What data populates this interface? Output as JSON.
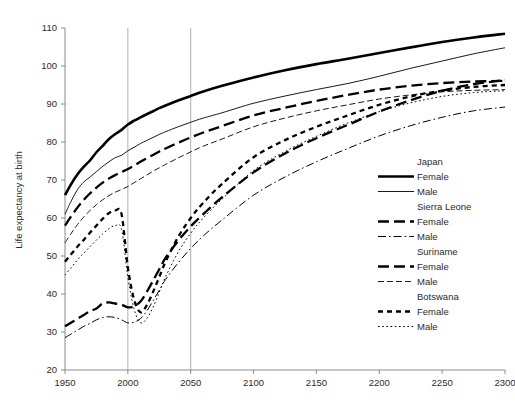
{
  "chart_data": {
    "type": "line",
    "title": "",
    "xlabel": "",
    "ylabel": "Life expectancy at birth",
    "xlim": [
      1950,
      2300
    ],
    "ylim": [
      20,
      110
    ],
    "xticks": [
      1950,
      2000,
      2050,
      2100,
      2150,
      2200,
      2250,
      2300
    ],
    "xtick_labels": [
      "1950",
      "2000",
      "2050",
      "2100",
      "2150",
      "2200",
      "2250",
      "2300"
    ],
    "yticks": [
      20,
      30,
      40,
      50,
      60,
      70,
      80,
      90,
      100,
      110
    ],
    "ytick_labels": [
      "20",
      "30",
      "40",
      "50",
      "60",
      "70",
      "80",
      "90",
      "100",
      "110"
    ],
    "grid": false,
    "vertical_reference_lines": [
      2000,
      2050
    ],
    "legend_position": "right-inside",
    "legend_groups": [
      {
        "country": "Japan",
        "entries": [
          {
            "label": "Female",
            "style": "solid-thick"
          },
          {
            "label": "Male",
            "style": "solid-thin"
          }
        ]
      },
      {
        "country": "Sierra Leone",
        "entries": [
          {
            "label": "Female",
            "style": "dashed-thick"
          },
          {
            "label": "Male",
            "style": "dashdot-thin"
          }
        ]
      },
      {
        "country": "Suriname",
        "entries": [
          {
            "label": "Female",
            "style": "dashed-thick"
          },
          {
            "label": "Male",
            "style": "dashed-thin"
          }
        ]
      },
      {
        "country": "Botswana",
        "entries": [
          {
            "label": "Female",
            "style": "dotted-dash-thick"
          },
          {
            "label": "Male",
            "style": "dotted-thin"
          }
        ]
      }
    ],
    "x": [
      1950,
      1955,
      1960,
      1965,
      1970,
      1975,
      1980,
      1985,
      1990,
      1995,
      2000,
      2005,
      2010,
      2015,
      2020,
      2025,
      2030,
      2040,
      2050,
      2060,
      2075,
      2100,
      2125,
      2150,
      2175,
      2200,
      2225,
      2250,
      2275,
      2300
    ],
    "series": [
      {
        "name": "Japan Female",
        "country": "Japan",
        "sex": "Female",
        "style": "solid-thick",
        "values": [
          66.0,
          69.0,
          71.5,
          73.5,
          75.2,
          77.3,
          79.0,
          80.8,
          82.1,
          83.2,
          84.6,
          85.6,
          86.5,
          87.3,
          88.1,
          88.9,
          89.6,
          90.9,
          92.1,
          93.3,
          94.8,
          97.0,
          98.9,
          100.5,
          101.9,
          103.4,
          104.9,
          106.3,
          107.5,
          108.5
        ]
      },
      {
        "name": "Japan Male",
        "country": "Japan",
        "sex": "Male",
        "style": "solid-thin",
        "values": [
          61.0,
          64.5,
          67.5,
          69.5,
          70.8,
          72.2,
          73.6,
          74.8,
          75.9,
          76.5,
          77.7,
          78.6,
          79.6,
          80.4,
          81.2,
          82.0,
          82.7,
          84.0,
          85.2,
          86.3,
          87.7,
          90.2,
          92.1,
          93.8,
          95.4,
          97.3,
          99.4,
          101.3,
          103.2,
          104.8
        ]
      },
      {
        "name": "Sierra Leone Female",
        "country": "Sierra Leone",
        "sex": "Female",
        "style": "dashed-thick",
        "values": [
          31.5,
          32.5,
          33.5,
          34.5,
          35.5,
          36.2,
          37.5,
          37.8,
          37.5,
          37.2,
          36.5,
          36.8,
          38.0,
          40.5,
          43.5,
          46.5,
          49.5,
          54.0,
          57.8,
          61.0,
          65.5,
          72.0,
          77.0,
          81.0,
          84.5,
          88.0,
          91.0,
          93.5,
          95.2,
          96.3
        ]
      },
      {
        "name": "Sierra Leone Male",
        "country": "Sierra Leone",
        "sex": "Male",
        "style": "dashdot-thin",
        "values": [
          28.5,
          29.5,
          30.5,
          31.5,
          32.3,
          33.2,
          33.8,
          34.0,
          33.8,
          33.2,
          32.4,
          32.6,
          33.5,
          35.5,
          38.2,
          41.0,
          43.8,
          48.2,
          52.0,
          55.3,
          59.5,
          66.0,
          70.8,
          74.8,
          78.3,
          81.6,
          84.3,
          86.5,
          88.2,
          89.2
        ]
      },
      {
        "name": "Suriname Female",
        "country": "Suriname",
        "sex": "Female",
        "style": "dashed-thick",
        "values": [
          58.0,
          60.5,
          62.8,
          64.8,
          66.5,
          68.0,
          69.3,
          70.4,
          71.3,
          72.1,
          72.9,
          73.8,
          74.8,
          75.7,
          76.6,
          77.5,
          78.3,
          79.8,
          81.2,
          82.5,
          84.2,
          87.0,
          89.0,
          90.8,
          92.4,
          93.8,
          94.8,
          95.5,
          95.9,
          96.1
        ]
      },
      {
        "name": "Suriname Male",
        "country": "Suriname",
        "sex": "Male",
        "style": "dashed-thin",
        "values": [
          53.5,
          56.0,
          58.3,
          60.3,
          62.0,
          63.5,
          64.8,
          65.9,
          66.8,
          67.5,
          68.3,
          69.3,
          70.3,
          71.3,
          72.3,
          73.2,
          74.1,
          75.8,
          77.4,
          78.9,
          80.8,
          84.0,
          86.3,
          88.2,
          89.8,
          91.3,
          92.4,
          93.2,
          93.6,
          93.8
        ]
      },
      {
        "name": "Botswana Female",
        "country": "Botswana",
        "sex": "Female",
        "style": "dotted-dash-thick",
        "values": [
          48.5,
          50.5,
          52.5,
          54.3,
          56.2,
          58.0,
          59.8,
          61.3,
          62.0,
          61.0,
          47.0,
          38.5,
          35.2,
          37.0,
          40.5,
          44.5,
          48.5,
          55.0,
          60.0,
          64.0,
          69.0,
          76.0,
          80.5,
          84.0,
          87.0,
          89.8,
          92.0,
          93.5,
          94.5,
          95.0
        ]
      },
      {
        "name": "Botswana Male",
        "country": "Botswana",
        "sex": "Male",
        "style": "dotted-thin",
        "values": [
          45.0,
          47.0,
          49.0,
          50.8,
          52.5,
          54.2,
          55.8,
          57.2,
          58.0,
          57.0,
          44.5,
          36.0,
          32.5,
          33.5,
          36.5,
          40.5,
          44.5,
          51.0,
          56.0,
          60.0,
          65.0,
          72.5,
          77.5,
          81.5,
          85.0,
          88.0,
          90.3,
          92.0,
          93.0,
          93.5
        ]
      }
    ]
  }
}
